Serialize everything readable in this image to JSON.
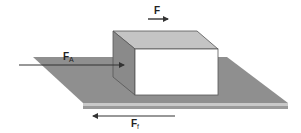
{
  "diagram": {
    "title": "",
    "labels": {
      "applied_force": {
        "main": "F",
        "sub": ""
      },
      "force_A": {
        "main": "F",
        "sub": "A"
      },
      "friction_force": {
        "main": "F",
        "sub": "f"
      }
    },
    "colors": {
      "plane": "#8f8f8f",
      "plane_edge": "#b8b8b8",
      "block_front": "#ffffff",
      "block_top": "#c4c4c4",
      "block_side": "#8a8a8a",
      "arrow": "#333333"
    }
  }
}
